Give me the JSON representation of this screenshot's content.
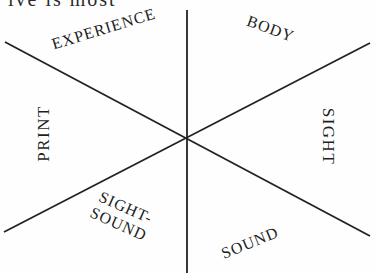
{
  "header_fragment": "ive is most",
  "diagram": {
    "center": {
      "x": 186,
      "y": 138
    },
    "line_color": "#222222",
    "lines": [
      {
        "name": "vertical",
        "x1": 187,
        "y1": 10,
        "x2": 187,
        "y2": 273
      },
      {
        "name": "diagonal-down",
        "x1": 5,
        "y1": 42,
        "x2": 370,
        "y2": 236
      },
      {
        "name": "diagonal-up",
        "x1": 4,
        "y1": 232,
        "x2": 370,
        "y2": 43
      }
    ],
    "sectors": {
      "top_left": "EXPERIENCE",
      "top_right": "BODY",
      "left": "PRINT",
      "right": "SIGHT",
      "bottom_left_line1": "SIGHT-",
      "bottom_left_line2": "SOUND",
      "bottom_right": "SOUND"
    }
  }
}
